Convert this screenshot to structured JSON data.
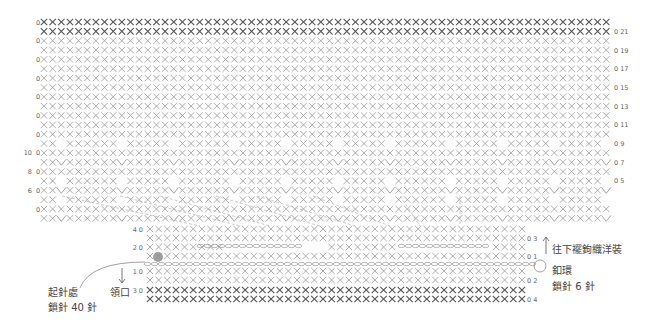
{
  "diagram": {
    "type": "crochet-chart",
    "top_panel": {
      "cols": 66,
      "rows": 22,
      "row_labels_right": [
        "21",
        "19",
        "17",
        "15",
        "13",
        "11",
        "9",
        "7",
        "5"
      ],
      "row_labels_left": [
        "10",
        "8",
        "6"
      ]
    },
    "bottom_panel": {
      "cols": 44,
      "upper_rows": 4,
      "lower_rows": 2,
      "row_labels_left": [
        "4",
        "2",
        "1",
        "3"
      ],
      "row_labels_right": [
        "3",
        "1",
        "2",
        "4"
      ]
    },
    "annotations": {
      "start_label_line1": "起針處",
      "start_label_line2": "鎖針 40 針",
      "neckline": "領口",
      "continue_skirt": "往下襬鉤織洋裝",
      "button_loop_line1": "釦環",
      "button_loop_line2": "鎖針 6 針"
    },
    "colors": {
      "stitch_light": "#9a9a9a",
      "stitch_dark": "#555555",
      "guide_line": "#b5b5b5",
      "start_dot": "#8a8a8a"
    }
  }
}
